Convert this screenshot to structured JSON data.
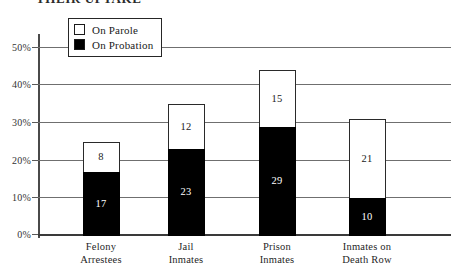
{
  "chart_data": {
    "type": "bar",
    "subtype": "stacked-bar",
    "title": "THEIR UPTAKE",
    "xlabel": "",
    "ylabel": "",
    "ylim": [
      0,
      52
    ],
    "yticks": [
      0,
      10,
      20,
      30,
      40,
      50
    ],
    "ytick_labels": [
      "0%",
      "10%",
      "20%",
      "30%",
      "40%",
      "50%"
    ],
    "grid": true,
    "legend_position": "top-left-inside",
    "categories": [
      "Felony Arrestees",
      "Jail Inmates",
      "Prison Inmates",
      "Inmates on Death Row"
    ],
    "category_lines": [
      [
        "Felony",
        "Arrestees"
      ],
      [
        "Jail",
        "Inmates"
      ],
      [
        "Prison",
        "Inmates"
      ],
      [
        "Inmates on",
        "Death Row"
      ]
    ],
    "series": [
      {
        "name": "On Probation",
        "color": "#000000",
        "values": [
          17,
          23,
          29,
          10
        ]
      },
      {
        "name": "On Parole",
        "color": "#ffffff",
        "values": [
          8,
          12,
          15,
          21
        ]
      }
    ],
    "totals": [
      25,
      35,
      44,
      31
    ]
  },
  "legend": {
    "items": [
      {
        "label": "On Parole",
        "swatch": "parole"
      },
      {
        "label": "On Probation",
        "swatch": "probation"
      }
    ]
  }
}
